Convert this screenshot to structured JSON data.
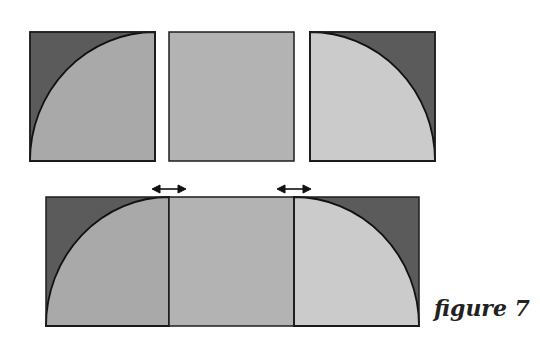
{
  "caption": "figure 7",
  "colors": {
    "dark": "#5b5b5b",
    "medium": "#a9a9a9",
    "plain": "#b3b3b3",
    "light": "#cbcbcb",
    "outline": "#1e1e1e"
  },
  "top_row": [
    {
      "name": "quarter-circle-left",
      "x": 30,
      "y": 32,
      "w": 125,
      "h": 129
    },
    {
      "name": "plain-square",
      "x": 169,
      "y": 32,
      "w": 125,
      "h": 129
    },
    {
      "name": "quarter-circle-right",
      "x": 310,
      "y": 32,
      "w": 125,
      "h": 129
    }
  ],
  "bottom_strip": {
    "x": 46,
    "y": 197,
    "w": 373,
    "h": 129,
    "seams": [
      169,
      294
    ]
  },
  "arrows": [
    {
      "cx": 169,
      "y": 189
    },
    {
      "cx": 294,
      "y": 189
    }
  ]
}
